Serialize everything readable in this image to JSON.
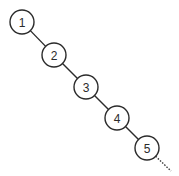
{
  "diagram": {
    "type": "degenerate-binary-tree",
    "colors": {
      "stroke": "#2b2b2b",
      "fill": "#ffffff",
      "text": "#2b2b2b"
    },
    "node_radius": 12,
    "nodes": [
      {
        "id": "n1",
        "label": "1",
        "cx": 22,
        "cy": 22
      },
      {
        "id": "n2",
        "label": "2",
        "cx": 54,
        "cy": 55
      },
      {
        "id": "n3",
        "label": "3",
        "cx": 86,
        "cy": 87
      },
      {
        "id": "n4",
        "label": "4",
        "cx": 117,
        "cy": 118
      },
      {
        "id": "n5",
        "label": "5",
        "cx": 147,
        "cy": 148
      }
    ],
    "edges": [
      {
        "from": "n1",
        "to": "n2",
        "style": "solid"
      },
      {
        "from": "n2",
        "to": "n3",
        "style": "solid"
      },
      {
        "from": "n3",
        "to": "n4",
        "style": "solid"
      },
      {
        "from": "n4",
        "to": "n5",
        "style": "solid"
      }
    ],
    "continuation": {
      "from": "n5",
      "x2": 171,
      "y2": 171,
      "style": "dotted"
    }
  }
}
